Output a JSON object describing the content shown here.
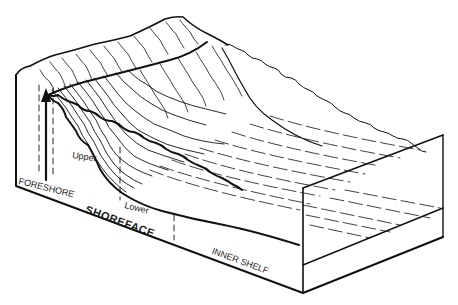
{
  "figure": {
    "type": "block diagram",
    "line_color": "#111111",
    "background": "#ffffff"
  },
  "labels": {
    "foreshore": "FORESHORE",
    "shoreface": "SHOREFACE",
    "upper": "Upper",
    "lower": "Lower",
    "inner_shelf": "INNER SHELF"
  },
  "annotations": {
    "arrow": "upward arrow marking foreshore-shoreface boundary"
  }
}
